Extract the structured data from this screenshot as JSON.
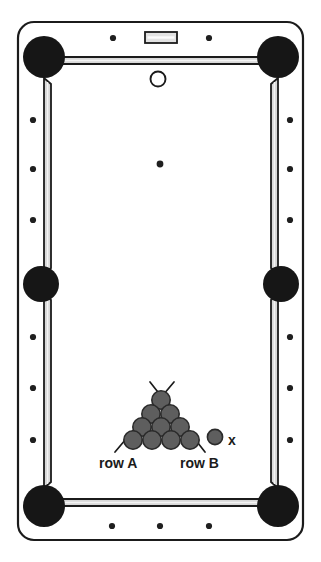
{
  "figure": {
    "type": "pool-table-diagram",
    "orientation": "portrait-top-down",
    "caption": ""
  },
  "labels": {
    "row_a": "row A",
    "row_b": "row B",
    "target_ball": "x"
  },
  "colors": {
    "outline": "#1b1b1b",
    "cushion_fill": "#d8d8d8",
    "cushion_highlight": "#f2f2f2",
    "pocket": "#161616",
    "ball_fill": "#5e5e5e",
    "ball_stroke": "#2a2a2a",
    "cue_ball_fill": "#ffffff",
    "table_bed": "#ffffff",
    "sight_dot": "#1f1f1f",
    "plate_fill": "#e2e2e2"
  },
  "table": {
    "frame": {
      "x": 18,
      "y": 22,
      "width": 285,
      "height": 518,
      "corner_radius": 16
    },
    "bed": {
      "x": 44,
      "y": 50,
      "width": 233,
      "height": 462
    },
    "plate": {
      "x": 145,
      "y": 32,
      "width": 32,
      "height": 11,
      "name": "rail-name-plate"
    },
    "pockets": [
      {
        "name": "pocket-top-left",
        "cx": 44,
        "cy": 57,
        "r": 21
      },
      {
        "name": "pocket-top-right",
        "cx": 278,
        "cy": 57,
        "r": 21
      },
      {
        "name": "pocket-side-left",
        "cx": 41,
        "cy": 284,
        "r": 18
      },
      {
        "name": "pocket-side-right",
        "cx": 281,
        "cy": 284,
        "r": 18
      },
      {
        "name": "pocket-bottom-left",
        "cx": 44,
        "cy": 506,
        "r": 21
      },
      {
        "name": "pocket-bottom-right",
        "cx": 278,
        "cy": 506,
        "r": 21
      }
    ],
    "sight_dots": [
      {
        "name": "sight-dot-top-1",
        "cx": 113,
        "cy": 38
      },
      {
        "name": "sight-dot-top-2",
        "cx": 209,
        "cy": 38
      },
      {
        "name": "sight-dot-left-1",
        "cx": 33,
        "cy": 120
      },
      {
        "name": "sight-dot-left-2",
        "cx": 33,
        "cy": 169
      },
      {
        "name": "sight-dot-left-3",
        "cx": 33,
        "cy": 220
      },
      {
        "name": "sight-dot-left-4",
        "cx": 33,
        "cy": 337
      },
      {
        "name": "sight-dot-left-5",
        "cx": 33,
        "cy": 388
      },
      {
        "name": "sight-dot-left-6",
        "cx": 33,
        "cy": 440
      },
      {
        "name": "sight-dot-right-1",
        "cx": 290,
        "cy": 120
      },
      {
        "name": "sight-dot-right-2",
        "cx": 290,
        "cy": 169
      },
      {
        "name": "sight-dot-right-3",
        "cx": 290,
        "cy": 220
      },
      {
        "name": "sight-dot-right-4",
        "cx": 290,
        "cy": 337
      },
      {
        "name": "sight-dot-right-5",
        "cx": 290,
        "cy": 388
      },
      {
        "name": "sight-dot-right-6",
        "cx": 290,
        "cy": 440
      },
      {
        "name": "sight-dot-bottom-1",
        "cx": 112,
        "cy": 526
      },
      {
        "name": "sight-dot-bottom-2",
        "cx": 160,
        "cy": 526
      },
      {
        "name": "sight-dot-bottom-3",
        "cx": 209,
        "cy": 526
      }
    ],
    "sight_dot_radius": 3.1,
    "center_spot": {
      "name": "table-center-spot",
      "cx": 160,
      "cy": 164,
      "r": 3.4
    },
    "cue_ball": {
      "name": "cue-ball",
      "cx": 158,
      "cy": 79,
      "r": 7.5
    }
  },
  "rack": {
    "name": "ball-rack-triangle",
    "rows": 4,
    "ball_radius": 9.2,
    "balls": [
      {
        "row": 1,
        "cx": 161,
        "cy": 400
      },
      {
        "row": 2,
        "cx": 151,
        "cy": 414
      },
      {
        "row": 2,
        "cx": 170,
        "cy": 414
      },
      {
        "row": 3,
        "cx": 142,
        "cy": 427
      },
      {
        "row": 3,
        "cx": 161,
        "cy": 427
      },
      {
        "row": 3,
        "cx": 180,
        "cy": 427
      },
      {
        "row": 4,
        "cx": 133,
        "cy": 440
      },
      {
        "row": 4,
        "cx": 152,
        "cy": 440
      },
      {
        "row": 4,
        "cx": 171,
        "cy": 440
      },
      {
        "row": 4,
        "cx": 190,
        "cy": 440
      }
    ],
    "cross_lines": [
      {
        "name": "pointer-line-row-a",
        "x1": 174,
        "y1": 382,
        "x2": 115,
        "y2": 452
      },
      {
        "name": "pointer-line-row-b",
        "x1": 150,
        "y1": 382,
        "x2": 205,
        "y2": 452
      }
    ],
    "loose_ball": {
      "name": "ball-x",
      "cx": 215,
      "cy": 437,
      "r": 7.6
    }
  }
}
